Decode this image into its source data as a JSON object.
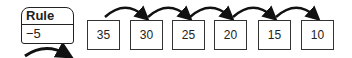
{
  "rule": {
    "title": "Rule",
    "value": "−5"
  },
  "sequence": [
    {
      "value": "35",
      "left": 87
    },
    {
      "value": "30",
      "left": 130
    },
    {
      "value": "25",
      "left": 172
    },
    {
      "value": "20",
      "left": 214
    },
    {
      "value": "15",
      "left": 258
    },
    {
      "value": "10",
      "left": 301
    }
  ],
  "colors": {
    "stroke": "#222222",
    "background": "#ffffff"
  }
}
